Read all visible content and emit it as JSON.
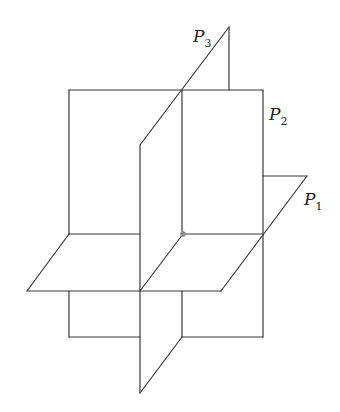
{
  "diagram": {
    "colors": {
      "line": "#3a3a3a",
      "point": "#8a8a8a",
      "background": "#ffffff"
    },
    "labels": [
      {
        "id": "P1",
        "letter": "P",
        "subscript": "1"
      },
      {
        "id": "P2",
        "letter": "P",
        "subscript": "2"
      },
      {
        "id": "P3",
        "letter": "P",
        "subscript": "3"
      }
    ],
    "intersection_point": {
      "x": 183,
      "y": 234
    }
  }
}
